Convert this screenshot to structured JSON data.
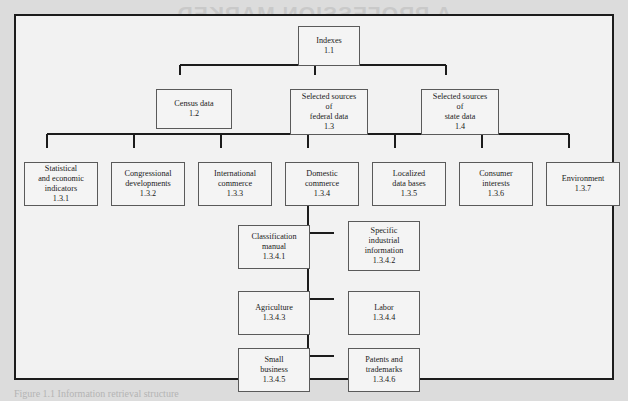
{
  "figure": {
    "showthrough_text": "A PROFESSION MARKED\nBY RECENT AND RAPID",
    "caption_text": "Figure 1.1  Information retrieval structure",
    "frame_color": "#1c1c1c",
    "box_border_color": "#5a5a5a",
    "link_color": "#1c1c1c",
    "page_background": "#dcdcdc",
    "figure_background": "#f2f2f2"
  },
  "nodes": [
    {
      "id": "indexes",
      "title": "Indexes",
      "code": "1.1",
      "label": "Indexes\n1.1",
      "x": 282,
      "y": 10,
      "w": 62,
      "h": 40
    },
    {
      "id": "census-data",
      "title": "Census data",
      "code": "1.2",
      "label": "Census data\n1.2",
      "x": 140,
      "y": 73,
      "w": 76,
      "h": 40
    },
    {
      "id": "federal-data",
      "title": "Selected sources of federal data",
      "code": "1.3",
      "label": "Selected sources\nof\nfederal data\n1.3",
      "x": 274,
      "y": 73,
      "w": 78,
      "h": 46
    },
    {
      "id": "state-data",
      "title": "Selected sources of state data",
      "code": "1.4",
      "label": "Selected sources\nof\nstate data\n1.4",
      "x": 405,
      "y": 73,
      "w": 78,
      "h": 46
    },
    {
      "id": "statistical-indicators",
      "title": "Statistical and economic indicators",
      "code": "1.3.1",
      "label": "Statistical\nand economic\nindicators\n1.3.1",
      "x": 8,
      "y": 146,
      "w": 74,
      "h": 44
    },
    {
      "id": "congressional",
      "title": "Congressional developments",
      "code": "1.3.2",
      "label": "Congressional\ndevelopments\n1.3.2",
      "x": 95,
      "y": 146,
      "w": 74,
      "h": 44
    },
    {
      "id": "international-commerce",
      "title": "International commerce",
      "code": "1.3.3",
      "label": "International\ncommerce\n1.3.3",
      "x": 182,
      "y": 146,
      "w": 74,
      "h": 44
    },
    {
      "id": "domestic-commerce",
      "title": "Domestic commerce",
      "code": "1.3.4",
      "label": "Domestic\ncommerce\n1.3.4",
      "x": 269,
      "y": 146,
      "w": 74,
      "h": 44
    },
    {
      "id": "localized-data-bases",
      "title": "Localized data bases",
      "code": "1.3.5",
      "label": "Localized\ndata bases\n1.3.5",
      "x": 356,
      "y": 146,
      "w": 74,
      "h": 44
    },
    {
      "id": "consumer-interests",
      "title": "Consumer interests",
      "code": "1.3.6",
      "label": "Consumer\ninterests\n1.3.6",
      "x": 443,
      "y": 146,
      "w": 74,
      "h": 44
    },
    {
      "id": "environment",
      "title": "Environment",
      "code": "1.3.7",
      "label": "Environment\n1.3.7",
      "x": 530,
      "y": 146,
      "w": 74,
      "h": 44
    },
    {
      "id": "classification-manual",
      "title": "Classification manual",
      "code": "1.3.4.1",
      "label": "Classification\nmanual\n1.3.4.1",
      "x": 222,
      "y": 209,
      "w": 72,
      "h": 44
    },
    {
      "id": "specific-industrial",
      "title": "Specific industrial information",
      "code": "1.3.4.2",
      "label": "Specific\nindustrial\ninformation\n1.3.4.2",
      "x": 332,
      "y": 205,
      "w": 72,
      "h": 50
    },
    {
      "id": "agriculture",
      "title": "Agriculture",
      "code": "1.3.4.3",
      "label": "Agriculture\n1.3.4.3",
      "x": 222,
      "y": 275,
      "w": 72,
      "h": 44
    },
    {
      "id": "labor",
      "title": "Labor",
      "code": "1.3.4.4",
      "label": "Labor\n1.3.4.4",
      "x": 332,
      "y": 275,
      "w": 72,
      "h": 44
    },
    {
      "id": "small-business",
      "title": "Small business",
      "code": "1.3.4.5",
      "label": "Small\nbusiness\n1.3.4.5",
      "x": 222,
      "y": 332,
      "w": 72,
      "h": 44
    },
    {
      "id": "patents-trademarks",
      "title": "Patents and trademarks",
      "code": "1.3.4.6",
      "label": "Patents and\ntrademarks\n1.3.4.6",
      "x": 332,
      "y": 332,
      "w": 72,
      "h": 44
    }
  ],
  "chart_data": {
    "type": "diagram",
    "diagram_kind": "organizational-tree",
    "title": "Information retrieval structure",
    "root": "1.1",
    "edges": [
      {
        "from": "1.1",
        "to": "1.2"
      },
      {
        "from": "1.1",
        "to": "1.3"
      },
      {
        "from": "1.1",
        "to": "1.4"
      },
      {
        "from": "1.3",
        "to": "1.3.1"
      },
      {
        "from": "1.3",
        "to": "1.3.2"
      },
      {
        "from": "1.3",
        "to": "1.3.3"
      },
      {
        "from": "1.3",
        "to": "1.3.4"
      },
      {
        "from": "1.3",
        "to": "1.3.5"
      },
      {
        "from": "1.3",
        "to": "1.3.6"
      },
      {
        "from": "1.3",
        "to": "1.3.7"
      },
      {
        "from": "1.3.4",
        "to": "1.3.4.1"
      },
      {
        "from": "1.3.4",
        "to": "1.3.4.2"
      },
      {
        "from": "1.3.4",
        "to": "1.3.4.3"
      },
      {
        "from": "1.3.4",
        "to": "1.3.4.4"
      },
      {
        "from": "1.3.4",
        "to": "1.3.4.5"
      },
      {
        "from": "1.3.4",
        "to": "1.3.4.6"
      }
    ]
  }
}
